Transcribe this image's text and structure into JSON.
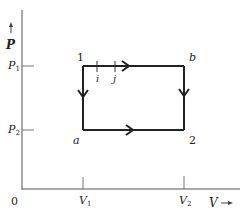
{
  "diagram": {
    "type": "P-V cycle diagram",
    "axes": {
      "y_label": "P",
      "x_label": "V",
      "origin_label": "0",
      "y_ticks": [
        {
          "label": "P",
          "sub": "1"
        },
        {
          "label": "P",
          "sub": "2"
        }
      ],
      "x_ticks": [
        {
          "label": "V",
          "sub": "1"
        },
        {
          "label": "V",
          "sub": "2"
        }
      ]
    },
    "corners": {
      "top_left": "1",
      "top_right": "b",
      "bottom_left": "a",
      "bottom_right": "2"
    },
    "intermediate_points": [
      "i",
      "j"
    ],
    "colors": {
      "line": "#222222",
      "axis": "#555555",
      "background": "#ffffff"
    }
  }
}
